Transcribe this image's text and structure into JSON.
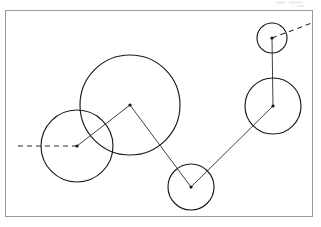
{
  "canvas": {
    "width": 321,
    "height": 227,
    "background_color": "#ffffff",
    "title": "Circle chain diagram"
  },
  "frame": {
    "name": "diagram-border",
    "x": 5.5,
    "y": 10.5,
    "width": 307,
    "height": 206,
    "stroke_color": "#9a9a9a",
    "stroke_width": 1
  },
  "style": {
    "circle_stroke": "#1a1a1a",
    "circle_stroke_width": 1.15,
    "link_stroke": "#2b2b2b",
    "link_stroke_width": 0.9,
    "dash_pattern": "5 4",
    "dot_radius": 1.6,
    "dot_color": "#111111"
  },
  "chart_data": {
    "type": "scatter",
    "xlabel": "",
    "ylabel": "",
    "xlim": [
      0,
      321
    ],
    "ylim": [
      0,
      227
    ],
    "grid": false,
    "legend": "none",
    "note": "Five circles of differing radii whose centres are joined by a polyline; two dashed rays leave the chain at each end.",
    "circles": [
      {
        "id": "left-circle",
        "label": "left",
        "cx": 77,
        "cy": 146,
        "r": 36
      },
      {
        "id": "big-circle",
        "label": "big",
        "cx": 130,
        "cy": 105,
        "r": 50
      },
      {
        "id": "bottom-circle",
        "label": "bottom",
        "cx": 191,
        "cy": 187,
        "r": 23
      },
      {
        "id": "right-circle",
        "label": "right",
        "cx": 273,
        "cy": 106,
        "r": 28
      },
      {
        "id": "topright-circle",
        "label": "top-right",
        "cx": 272,
        "cy": 38,
        "r": 15
      }
    ],
    "centers": {
      "x": [
        77,
        130,
        191,
        273,
        272
      ],
      "y": [
        146,
        105,
        187,
        106,
        38
      ],
      "radii": [
        36,
        50,
        23,
        28,
        15
      ]
    },
    "links": [
      {
        "id": "link-left-big",
        "from": "left-circle",
        "to": "big-circle",
        "x1": 77,
        "y1": 146,
        "x2": 130,
        "y2": 105,
        "style": "solid"
      },
      {
        "id": "link-big-bottom",
        "from": "big-circle",
        "to": "bottom-circle",
        "x1": 130,
        "y1": 105,
        "x2": 191,
        "y2": 187,
        "style": "solid"
      },
      {
        "id": "link-bottom-right",
        "from": "bottom-circle",
        "to": "right-circle",
        "x1": 191,
        "y1": 187,
        "x2": 273,
        "y2": 106,
        "style": "solid"
      },
      {
        "id": "link-right-topright",
        "from": "right-circle",
        "to": "topright-circle",
        "x1": 273,
        "y1": 106,
        "x2": 272,
        "y2": 38,
        "style": "solid"
      }
    ],
    "rays": [
      {
        "id": "ray-left",
        "from": "left-circle",
        "x1": 77,
        "y1": 146,
        "x2": 16,
        "y2": 146,
        "style": "dashed"
      },
      {
        "id": "ray-topright",
        "from": "topright-circle",
        "x1": 272,
        "y1": 38,
        "x2": 312,
        "y2": 23,
        "style": "dashed"
      }
    ]
  }
}
